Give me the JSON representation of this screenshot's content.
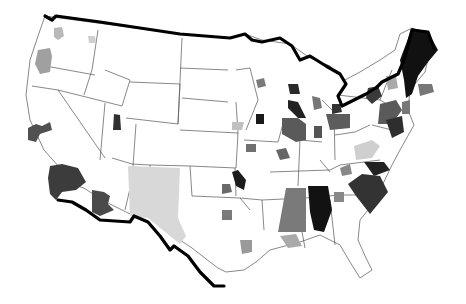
{
  "map": {
    "type": "choropleth",
    "region": "Contiguous United States",
    "palette": {
      "very_light": "#d8d8d8",
      "light": "#a8a8a8",
      "medium": "#6e6e6e",
      "dark": "#3e3e3e",
      "black": "#141414",
      "border": "#000000",
      "state_line": "#555555",
      "background": "#ffffff"
    },
    "emphasized_borders": [
      "us-canada-border",
      "us-mexico-border"
    ]
  }
}
